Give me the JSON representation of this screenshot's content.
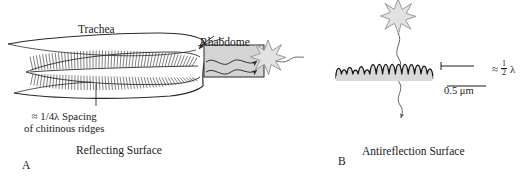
{
  "figure": {
    "panel_a": {
      "id": "A",
      "caption": "Reflecting Surface",
      "labels": {
        "trachea": "Trachea",
        "rhabdome": "Rhabdome",
        "spacing_line1": "≈ 1/4λ Spacing",
        "spacing_line2": "of chitinous ridges"
      }
    },
    "panel_b": {
      "id": "B",
      "caption": "Antireflection Surface",
      "labels": {
        "approx": "≈",
        "fraction_numerator": "1",
        "fraction_denominator": "2",
        "lambda": "λ",
        "scale_bar": "0.5 μm"
      }
    }
  },
  "colors": {
    "ink": "#1a1a1a",
    "line": "#2b2b2b",
    "rhabdome_fill": "#d4d4d4",
    "substrate_fill": "#d9d9d9",
    "star_fill": "#e2e2e2",
    "star_stroke": "#9a9a9a",
    "background": "#ffffff"
  }
}
